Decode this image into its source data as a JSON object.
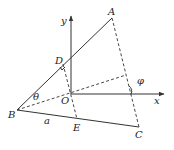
{
  "diagram": {
    "type": "geometry",
    "points": {
      "A": {
        "label": "A",
        "x": 112,
        "y": 18
      },
      "B": {
        "label": "B",
        "x": 17,
        "y": 110
      },
      "C": {
        "label": "C",
        "x": 139,
        "y": 127
      },
      "D": {
        "label": "D",
        "x": 71,
        "y": 58
      },
      "E": {
        "label": "E",
        "x": 77,
        "y": 119
      },
      "O": {
        "label": "O",
        "x": 71,
        "y": 94
      }
    },
    "axes": {
      "x_label": "x",
      "y_label": "y"
    },
    "angle_labels": {
      "theta": "θ",
      "phi": "φ"
    },
    "side_labels": {
      "a": "a"
    }
  }
}
